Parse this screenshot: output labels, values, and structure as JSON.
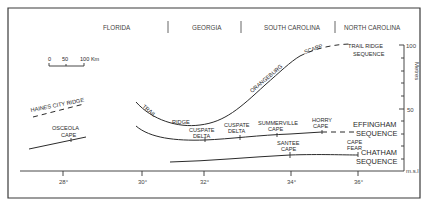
{
  "regions": [
    {
      "label": "FLORIDA"
    },
    {
      "label": "GEORGIA"
    },
    {
      "label": "SOUTH CAROLINA"
    },
    {
      "label": "NORTH CAROLINA"
    }
  ],
  "scale_bar": {
    "ticks": [
      "0",
      "50",
      "100 Km"
    ]
  },
  "x_axis": {
    "ticks": [
      "28°",
      "30°",
      "32°",
      "34°",
      "36°"
    ]
  },
  "y_axis": {
    "label": "Metres",
    "ticks": [
      "100",
      "50",
      "m.s.l"
    ]
  },
  "features": {
    "haines_city_ridge": "HAINES CITY RIDGE",
    "osceola_cape_1": "OSCEOLA",
    "osceola_cape_2": "CAPE",
    "trail": "TRAIL",
    "ridge": "RIDGE",
    "orangeburg": "ORANGEBURG",
    "scarp": "SCARP",
    "trail_ridge_seq_1": "TRAIL RIDGE",
    "trail_ridge_seq_2": "SEQUENCE",
    "cuspate_delta_a_1": "CUSPATE",
    "cuspate_delta_a_2": "DELTA",
    "cuspate_delta_b_1": "CUSPATE",
    "cuspate_delta_b_2": "DELTA",
    "summerville_1": "SUMMERVILLE",
    "summerville_2": "CAPE",
    "horry_1": "HORRY",
    "horry_2": "CAPE",
    "effingham_1": "EFFINGHAM",
    "effingham_2": "SEQUENCE",
    "santee_1": "SANTEE",
    "santee_2": "CAPE",
    "cape_fear_1": "CAPE",
    "cape_fear_2": "FEAR",
    "chatham_1": "CHATHAM",
    "chatham_2": "SEQUENCE"
  }
}
